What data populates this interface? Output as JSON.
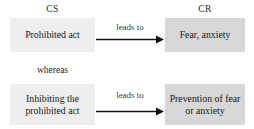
{
  "diagram": {
    "type": "classical-conditioning-flow",
    "columns": {
      "left_label": "CS",
      "right_label": "CR"
    },
    "connector": {
      "label": "whereas"
    },
    "rows": [
      {
        "id": "row-1",
        "stimulus": "Prohibited act",
        "arrow_label": "leads to",
        "response": "Fear, anxiety"
      },
      {
        "id": "row-2",
        "stimulus": "Inhibiting the prohibited act",
        "arrow_label": "leads to",
        "response": "Prevention of fear or anxiety"
      }
    ],
    "colors": {
      "stimulus_box_fill": "#eeeeee",
      "response_box_fill": "#d7d7d7",
      "arrow_color": "#111111",
      "text_color": "#1a1a1a",
      "background": "#ffffff"
    }
  }
}
